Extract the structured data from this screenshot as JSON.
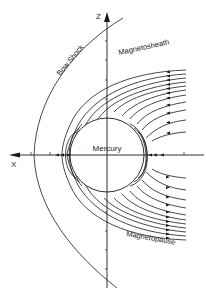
{
  "diagram": {
    "labels": {
      "planet": "Mercury",
      "bow_shock": "Bow Shock",
      "magnetosheath": "Magnetosheath",
      "magnetopause": "Magnetopause",
      "x_axis": "X",
      "z_axis": "Z"
    },
    "colors": {
      "ink": "#1a1a1a",
      "background": "#ffffff"
    }
  }
}
